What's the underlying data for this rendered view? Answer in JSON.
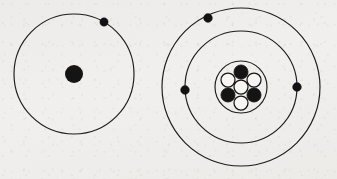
{
  "figure": {
    "background_color": "#f2f1ef",
    "ink_color": "#1b1b1b",
    "width": 337,
    "height": 179
  },
  "chart_data": {
    "type": "diagram",
    "subtitle": "Two atoms shown side by side: a single-shell atom and a two-shell atom",
    "xlabel": "",
    "ylabel": "",
    "grid": false,
    "legend": "none",
    "atoms": [
      {
        "id": "atom-left",
        "label": "single-shell atom",
        "center": {
          "x": 74,
          "y": 74
        },
        "nucleus": {
          "style": "solid-dot",
          "radius": 9,
          "color": "#141414",
          "particles": []
        },
        "shells": [
          {
            "index": 1,
            "radius": 60,
            "electron_count": 1,
            "electrons": [
              {
                "angle_deg": -60,
                "x": 104,
                "y": 22
              }
            ]
          }
        ],
        "total_electrons": 1
      },
      {
        "id": "atom-right",
        "label": "two-shell atom",
        "center": {
          "x": 241,
          "y": 87
        },
        "nucleus": {
          "style": "outlined-cluster",
          "radius": 26,
          "color": "#141414",
          "proton_count": 3,
          "neutron_count": 4,
          "particle_radius": 7,
          "particles": [
            {
              "type": "neutron",
              "position": "center",
              "x": 241,
              "y": 87
            },
            {
              "type": "proton",
              "position": "top",
              "x": 241,
              "y": 72
            },
            {
              "type": "neutron",
              "position": "upper-left",
              "x": 228,
              "y": 80
            },
            {
              "type": "neutron",
              "position": "upper-right",
              "x": 254,
              "y": 80
            },
            {
              "type": "proton",
              "position": "lower-left",
              "x": 228,
              "y": 95
            },
            {
              "type": "proton",
              "position": "lower-right",
              "x": 254,
              "y": 95
            },
            {
              "type": "neutron",
              "position": "bottom",
              "x": 241,
              "y": 103
            }
          ]
        },
        "shells": [
          {
            "index": 1,
            "radius": 56,
            "electron_count": 2,
            "electrons": [
              {
                "angle_deg": 180,
                "x": 185,
                "y": 90
              },
              {
                "angle_deg": 0,
                "x": 297,
                "y": 87
              }
            ]
          },
          {
            "index": 2,
            "radius": 79,
            "electron_count": 1,
            "electrons": [
              {
                "angle_deg": -155,
                "x": 208,
                "y": 18
              }
            ]
          }
        ],
        "total_electrons": 3
      }
    ],
    "legend_entries": [
      {
        "key": "proton",
        "marker": "filled-circle",
        "color": "#141414"
      },
      {
        "key": "neutron",
        "marker": "hollow-circle",
        "color": "#f6f5f3"
      },
      {
        "key": "electron",
        "marker": "small-filled-dot",
        "color": "#121212"
      }
    ]
  }
}
